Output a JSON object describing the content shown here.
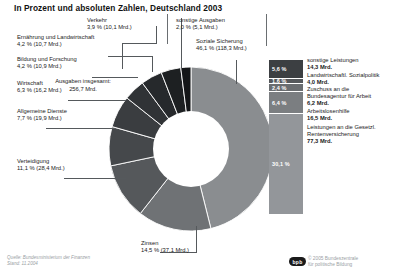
{
  "title": "In Prozent und absoluten Zahlen, Deutschland 2003",
  "center": {
    "line1": "Ausgaben insgesamt:",
    "line2": "256,7 Mrd."
  },
  "footer": {
    "source_line1": "Quelle: Bundesministerium der Finanzen",
    "source_line2": "Stand: 11.2004",
    "logo_text": "bpb",
    "credit_line1": "© 2005 Bundeszentrale",
    "credit_line2": "für politische Bildung"
  },
  "chart_data": {
    "type": "pie",
    "title": "In Prozent und absoluten Zahlen, Deutschland 2003",
    "total_label": "Ausgaben insgesamt:",
    "total_value": "256,7 Mrd.",
    "unit": "Mrd.",
    "categories": [
      "Soziale Sicherung",
      "Zinsen",
      "Verteidigung",
      "Allgemeine Dienste",
      "Wirtschaft",
      "Bildung und Forschung",
      "Ernährung und Landwirtschaft",
      "Verkehr",
      "sonstige Ausgaben"
    ],
    "values": [
      46.1,
      14.5,
      11.1,
      7.7,
      6.3,
      4.2,
      4.2,
      3.9,
      2.0
    ],
    "absolute": [
      118.3,
      37.1,
      28.4,
      19.9,
      16.2,
      10.9,
      10.7,
      10.1,
      5.1
    ],
    "legend": "inline-callouts",
    "slices": [
      {
        "name": "Soziale Sicherung",
        "pct": "46,1 %",
        "abs": "(118,3 Mrd.)",
        "color": "#8a8d90"
      },
      {
        "name": "Zinsen",
        "pct": "14,5 %",
        "abs": "(37,1 Mrd.)",
        "color": "#6f7275"
      },
      {
        "name": "Verteidigung",
        "pct": "11,1 %",
        "abs": "(28,4 Mrd.)",
        "color": "#55585b"
      },
      {
        "name": "Allgemeine Dienste",
        "pct": "7,7 %",
        "abs": "(19,9 Mrd.)",
        "color": "#45484b"
      },
      {
        "name": "Wirtschaft",
        "pct": "6,3 %",
        "abs": "(16,2 Mrd.)",
        "color": "#3a3d40"
      },
      {
        "name": "Bildung und Forschung",
        "pct": "4,2 %",
        "abs": "(10,9 Mrd.)",
        "color": "#303336"
      },
      {
        "name": "Ernährung und Landwirtschaft",
        "pct": "4,2 %",
        "abs": "(10,7 Mrd.)",
        "color": "#26292c"
      },
      {
        "name": "Verkehr",
        "pct": "3,9 %",
        "abs": "(10,1 Mrd.)",
        "color": "#1d2022"
      },
      {
        "name": "sonstige Ausgaben",
        "pct": "2,0 %",
        "abs": "(5,1 Mrd.)",
        "color": "#141618"
      }
    ],
    "breakout": {
      "of_category": "Soziale Sicherung",
      "type": "stacked-bar",
      "segments": [
        {
          "pct": "5,6 %",
          "name": "sonstige Leistungen",
          "value": "14,3 Mrd.",
          "pct_num": 5.6,
          "color": "#3c3f42"
        },
        {
          "pct": "1,6 %",
          "name": "Landwirtschaftl. Sozialpolitik",
          "value": "4,0 Mrd.",
          "pct_num": 1.6,
          "color": "#55585b"
        },
        {
          "pct": "2,4 %",
          "name": "Zuschuss an die Bundesagentur für Arbeit",
          "value": "6,2 Mrd.",
          "pct_num": 2.4,
          "color": "#6a6d70"
        },
        {
          "pct": "6,4 %",
          "name": "Arbeitslosenhilfe",
          "value": "16,5 Mrd.",
          "pct_num": 6.4,
          "color": "#7b7e81"
        },
        {
          "pct": "30,1 %",
          "name": "Leistungen an die Gesetzl. Rentenversicherung",
          "value": "77,3 Mrd.",
          "pct_num": 30.1,
          "color": "#93969a"
        }
      ]
    }
  },
  "labels": {
    "verkehr": {
      "name": "Verkehr",
      "val": "3,9 % (10,1 Mrd.)"
    },
    "sonstige": {
      "name": "sonstige Ausgaben",
      "val": "2,0 % (5,1 Mrd.)"
    },
    "ernaehrung": {
      "name": "Ernährung und Landwirtschaft",
      "val": "4,2 % (10,7 Mrd.)"
    },
    "soziale": {
      "name": "Soziale Sicherung",
      "val": "46,1 % (118,3 Mrd.)"
    },
    "bildung": {
      "name": "Bildung und Forschung",
      "val": "4,2 % (10,9 Mrd.)"
    },
    "wirtschaft": {
      "name": "Wirtschaft",
      "val": "6,3 % (16,2 Mrd.)"
    },
    "dienste": {
      "name": "Allgemeine Dienste",
      "val": "7,7 % (19,9 Mrd.)"
    },
    "verteidigung": {
      "name": "Verteidigung",
      "val": "11,1 % (28,4 Mrd.)"
    },
    "zinsen": {
      "name": "Zinsen",
      "val": "14,5 % (37,1 Mrd.)"
    }
  },
  "right_panel": [
    {
      "pct": "5,6 %",
      "name": "sonstige Leistungen",
      "value": "14,3 Mrd."
    },
    {
      "pct": "1,6 %",
      "name": "Landwirtschaftl. Sozialpolitik",
      "value": "4,0 Mrd."
    },
    {
      "pct": "2,4 %",
      "name": "Zuschuss an die\nBundesagentur für Arbeit",
      "value": "6,2 Mrd."
    },
    {
      "pct": "6,4 %",
      "name": "Arbeitslosenhilfe",
      "value": "16,5 Mrd."
    },
    {
      "pct": "30,1 %",
      "name": "Leistungen an die Gesetzl.\nRentenversicherung",
      "value": "77,3 Mrd."
    }
  ]
}
